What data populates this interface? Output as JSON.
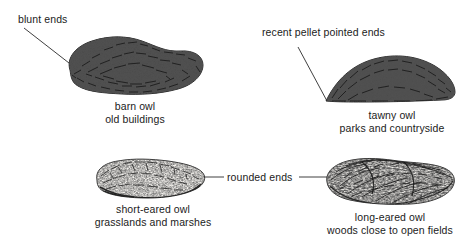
{
  "figure": {
    "background_color": "#ffffff",
    "ink_color": "#1b1b1b"
  },
  "annotations": [
    {
      "id": "blunt-ends",
      "text": "blunt ends",
      "lines": [
        "blunt ends"
      ],
      "points_to": "barn-owl-pellet"
    },
    {
      "id": "recent-pellet",
      "text": "recent pellet pointed ends",
      "lines": [
        "recent pellet",
        "pointed ends"
      ],
      "points_to": "tawny-owl-pellet"
    },
    {
      "id": "rounded-ends",
      "text": "rounded ends",
      "lines": [
        "rounded ends"
      ],
      "points_to": "short-eared-owl-pellet and long-eared-owl-pellet"
    }
  ],
  "specimens": [
    {
      "id": "barn-owl",
      "species": "barn owl",
      "habitat": "old buildings",
      "texture": "dark dense compacted fur with embedded bone fragments",
      "shape": "elongated rounded lobed mass with blunt ends"
    },
    {
      "id": "tawny-owl",
      "species": "tawny owl",
      "habitat": "parks and countryside",
      "texture": "dark granular fur with pale bone flecks",
      "shape": "crescent dome with pointed ends"
    },
    {
      "id": "short-eared-owl",
      "species": "short-eared owl",
      "habitat": "grasslands and marshes",
      "texture": "light scribbled fur with dark shading beneath",
      "shape": "oval mass with rounded ends"
    },
    {
      "id": "long-eared-owl",
      "species": "long-eared owl",
      "habitat": "woods close to open fields",
      "texture": "loose fibrous matted fur, lumpy surface",
      "shape": "bumpy elongated mass with rounded ends"
    }
  ],
  "captions": {
    "barn_owl": {
      "species": "barn owl",
      "habitat": "old buildings"
    },
    "tawny_owl": {
      "species": "tawny owl",
      "habitat": "parks and countryside"
    },
    "short_eared_owl": {
      "species": "short-eared owl",
      "habitat": "grasslands and marshes"
    },
    "long_eared_owl": {
      "species": "long-eared owl",
      "habitat": "woods close to open fields"
    }
  },
  "callouts": {
    "blunt_ends": "blunt ends",
    "recent_pellet_line1": "recent pellet",
    "recent_pellet_line2": "pointed ends",
    "rounded_ends": "rounded ends"
  }
}
